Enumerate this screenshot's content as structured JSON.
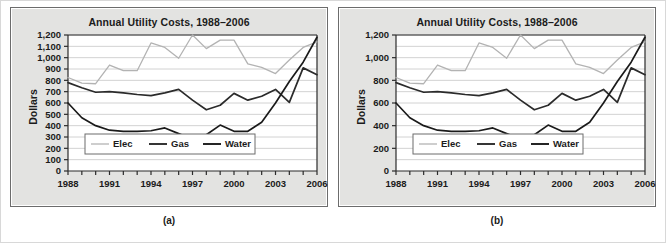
{
  "figure": {
    "panels": [
      {
        "caption": "(a)",
        "ylabel": "Dollars",
        "tick_step": 100
      },
      {
        "caption": "(b)",
        "ylabel": "Dollars",
        "tick_step": 200
      }
    ]
  },
  "chart_data": {
    "type": "line",
    "title": "Annual Utility Costs, 1988–2006",
    "xlabel": "",
    "ylabel": "Dollars",
    "ylim": [
      0,
      1200
    ],
    "grid": true,
    "legend_position": "lower-left-inside",
    "x": [
      1988,
      1989,
      1990,
      1991,
      1992,
      1993,
      1994,
      1995,
      1996,
      1997,
      1998,
      1999,
      2000,
      2001,
      2002,
      2003,
      2004,
      2005,
      2006
    ],
    "xtick_labels": [
      "1988",
      "",
      "",
      "1991",
      "",
      "",
      "1994",
      "",
      "",
      "1997",
      "",
      "",
      "2000",
      "",
      "",
      "2003",
      "",
      "",
      "2006"
    ],
    "xtick_labeled": [
      "1988",
      "1991",
      "1994",
      "1997",
      "2000",
      "2003",
      "2006"
    ],
    "ytick_labels_a": [
      "0",
      "100",
      "200",
      "300",
      "400",
      "500",
      "600",
      "700",
      "800",
      "900",
      "1,000",
      "1,100",
      "1,200"
    ],
    "ytick_values_a": [
      0,
      100,
      200,
      300,
      400,
      500,
      600,
      700,
      800,
      900,
      1000,
      1100,
      1200
    ],
    "ytick_labels_b": [
      "0",
      "200",
      "400",
      "600",
      "800",
      "1,000",
      "1,200"
    ],
    "ytick_values_b": [
      0,
      200,
      400,
      600,
      800,
      1000,
      1200
    ],
    "series": [
      {
        "name": "Elec",
        "color": "#b3b3b3",
        "values": [
          825,
          775,
          770,
          935,
          885,
          885,
          1130,
          1090,
          995,
          1200,
          1080,
          1155,
          1155,
          945,
          915,
          860,
          980,
          1090,
          1140
        ]
      },
      {
        "name": "Gas",
        "color": "#2b2b2b",
        "values": [
          780,
          735,
          695,
          700,
          690,
          675,
          665,
          690,
          720,
          625,
          540,
          580,
          685,
          625,
          660,
          720,
          605,
          910,
          850
        ]
      },
      {
        "name": "Water",
        "color": "#1a1a1a",
        "values": [
          600,
          470,
          400,
          360,
          350,
          350,
          355,
          380,
          330,
          280,
          320,
          405,
          350,
          350,
          430,
          600,
          790,
          960,
          1180
        ]
      }
    ]
  }
}
